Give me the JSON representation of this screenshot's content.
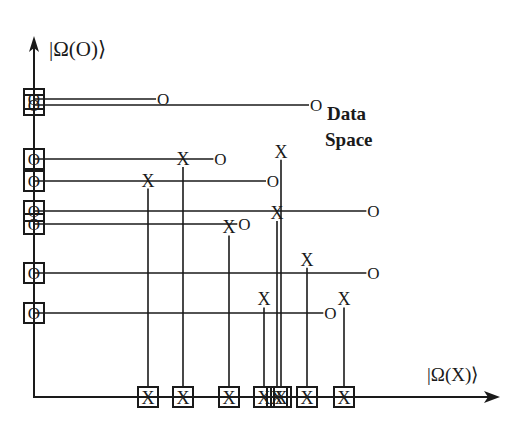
{
  "diagram": {
    "y_axis_label": "|Ω(O)⟩",
    "x_axis_label": "|Ω(X)⟩",
    "space_label_line1": "Data",
    "space_label_line2": "Space",
    "o_symbol": "O",
    "x_symbol": "X",
    "o_points": [
      {
        "row": 1,
        "reach": 0.27
      },
      {
        "row": 2,
        "reach": 0.59
      },
      {
        "row": 3,
        "reach": 0.39
      },
      {
        "row": 4,
        "reach": 0.5
      },
      {
        "row": 5,
        "reach": 0.71
      },
      {
        "row": 6,
        "reach": 0.44
      },
      {
        "row": 7,
        "reach": 0.71
      },
      {
        "row": 8,
        "reach": 0.62
      }
    ],
    "x_points": [
      {
        "col": 1,
        "reach": 0.59
      },
      {
        "col": 2,
        "reach": 0.65
      },
      {
        "col": 3,
        "reach": 0.46
      },
      {
        "col": 4,
        "reach": 0.26
      },
      {
        "col": 5,
        "reach": 0.5
      },
      {
        "col": 6,
        "reach": 0.67
      },
      {
        "col": 7,
        "reach": 0.37
      },
      {
        "col": 8,
        "reach": 0.26
      }
    ]
  }
}
